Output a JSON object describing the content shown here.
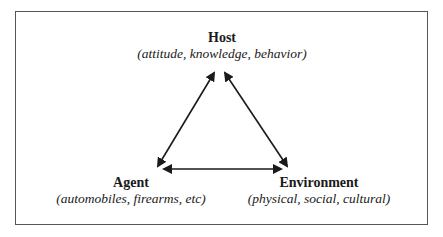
{
  "diagram": {
    "type": "epidemiological-triangle",
    "nodes": {
      "host": {
        "title": "Host",
        "subtitle": "(attitude, knowledge, behavior)"
      },
      "agent": {
        "title": "Agent",
        "subtitle": "(automobiles, firearms, etc)"
      },
      "environment": {
        "title": "Environment",
        "subtitle": "(physical, social, cultural)"
      }
    },
    "edges": [
      {
        "from": "agent",
        "to": "host",
        "style": "double-arrow"
      },
      {
        "from": "host",
        "to": "environment",
        "style": "double-arrow"
      },
      {
        "from": "agent",
        "to": "environment",
        "style": "double-arrow"
      }
    ],
    "colors": {
      "border": "#555555",
      "arrow": "#1a1a1a",
      "text": "#1a1a1a",
      "background": "#ffffff"
    }
  }
}
